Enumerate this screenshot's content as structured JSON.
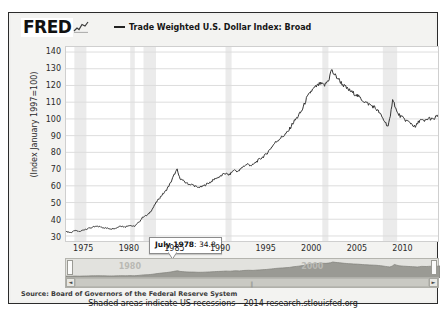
{
  "header": {
    "logo": "FRED",
    "logo_icon": "squiggle-chart-icon",
    "legend_label": "Trade Weighted U.S. Dollar Index: Broad"
  },
  "axes": {
    "ylabel": "(Index January 1997=100)",
    "yticks": [
      "140",
      "130",
      "120",
      "110",
      "100",
      "90",
      "80",
      "70",
      "60",
      "50",
      "40",
      "30"
    ],
    "xticks": [
      "1975",
      "1980",
      "1985",
      "1990",
      "1995",
      "2000",
      "2005",
      "2010"
    ]
  },
  "tooltip": {
    "date": "July 1978",
    "separator": ": ",
    "value": "34.8"
  },
  "navigator": {
    "year_left": "1980",
    "year_right": "2000",
    "scroll_left_arrow": "◄",
    "scroll_right_arrow": "►",
    "scroll_grip": "‖"
  },
  "footer": {
    "source": "Source: Board of Governors of the Federal Reserve System",
    "note": "Shaded areas indicate US recessions - 2014 research.stlouisfed.org"
  },
  "colors": {
    "line": "#333333",
    "recession_band": "#ebebeb",
    "grid": "#dddddd",
    "frame": "#2b2b2b",
    "page_bg": "#f3f3f1",
    "nav_area": "#9a9a94"
  },
  "chart_data": {
    "type": "line",
    "title": "Trade Weighted U.S. Dollar Index: Broad",
    "xlabel": "",
    "ylabel": "(Index January 1997=100)",
    "xlim": [
      1973.0,
      2014.0
    ],
    "ylim": [
      27,
      143
    ],
    "grid": true,
    "legend_position": "top",
    "annotations": [
      {
        "x": 1978.54,
        "y": 34.8,
        "text": "July 1978: 34.8"
      }
    ],
    "recessions": [
      [
        1973.92,
        1975.25
      ],
      [
        1980.08,
        1980.58
      ],
      [
        1981.54,
        1982.92
      ],
      [
        1990.58,
        1991.25
      ],
      [
        2001.25,
        2001.92
      ],
      [
        2007.92,
        2009.5
      ]
    ],
    "series": [
      {
        "name": "Trade Weighted U.S. Dollar Index: Broad",
        "x": [
          1973.0,
          1973.5,
          1974.0,
          1974.5,
          1975.0,
          1975.5,
          1976.0,
          1976.5,
          1977.0,
          1977.5,
          1978.0,
          1978.54,
          1979.0,
          1979.5,
          1980.0,
          1980.5,
          1981.0,
          1981.5,
          1982.0,
          1982.5,
          1983.0,
          1983.5,
          1984.0,
          1984.5,
          1985.0,
          1985.25,
          1985.5,
          1986.0,
          1986.5,
          1987.0,
          1987.5,
          1988.0,
          1988.5,
          1989.0,
          1989.5,
          1990.0,
          1990.5,
          1991.0,
          1991.5,
          1992.0,
          1992.5,
          1993.0,
          1993.5,
          1994.0,
          1994.5,
          1995.0,
          1995.5,
          1996.0,
          1996.5,
          1997.0,
          1997.5,
          1998.0,
          1998.5,
          1999.0,
          1999.5,
          2000.0,
          2000.5,
          2001.0,
          2001.5,
          2002.0,
          2002.25,
          2002.5,
          2003.0,
          2003.5,
          2004.0,
          2004.5,
          2005.0,
          2005.5,
          2006.0,
          2006.5,
          2007.0,
          2007.5,
          2008.0,
          2008.5,
          2008.75,
          2009.0,
          2009.25,
          2009.5,
          2010.0,
          2010.5,
          2011.0,
          2011.5,
          2012.0,
          2012.5,
          2013.0,
          2013.5,
          2014.0
        ],
        "y": [
          32.8,
          32.0,
          33.2,
          32.6,
          33.8,
          34.6,
          35.3,
          35.8,
          35.2,
          34.6,
          34.3,
          34.8,
          36.1,
          35.4,
          36.5,
          35.6,
          38.0,
          41.5,
          42.5,
          46.0,
          50.5,
          54.0,
          57.0,
          61.5,
          67.5,
          69.5,
          65.0,
          62.5,
          61.0,
          60.5,
          59.0,
          59.5,
          61.0,
          62.5,
          64.5,
          65.5,
          67.5,
          66.5,
          69.5,
          68.5,
          71.5,
          73.0,
          72.0,
          74.5,
          76.5,
          78.5,
          82.0,
          85.5,
          88.0,
          90.0,
          92.5,
          97.5,
          101.0,
          105.0,
          112.0,
          116.5,
          119.0,
          121.0,
          120.0,
          124.0,
          129.5,
          127.0,
          124.0,
          120.5,
          118.0,
          116.0,
          114.5,
          112.0,
          110.0,
          108.5,
          107.0,
          104.0,
          99.5,
          95.5,
          101.0,
          112.5,
          108.0,
          103.5,
          101.0,
          99.0,
          97.5,
          95.0,
          99.5,
          98.5,
          100.5,
          99.5,
          102.5
        ]
      }
    ]
  }
}
